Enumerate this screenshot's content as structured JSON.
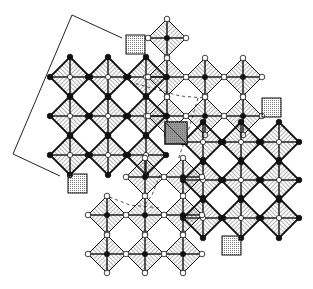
{
  "figure": {
    "colors": {
      "ink": "#111111",
      "hatch": "#555555",
      "shade": "#bbbbbb",
      "background": "#ffffff"
    }
  },
  "blocks": [
    {
      "name": "upper-left",
      "bold": true,
      "center_fill": "open",
      "apex_fill": "black",
      "cols": [
        70,
        108,
        146
      ],
      "rows": [
        77,
        116,
        155
      ],
      "r": 20
    },
    {
      "name": "upper-right",
      "bold": false,
      "center_fill": "black",
      "apex_fill": "open",
      "cols": [
        167,
        205,
        243
      ],
      "rows": [
        38,
        77,
        116
      ],
      "r": 19,
      "skip": [
        [
          0,
          1
        ],
        [
          0,
          2
        ]
      ]
    },
    {
      "name": "lower-right",
      "bold": true,
      "center_fill": "open",
      "apex_fill": "black",
      "cols": [
        203,
        241,
        279
      ],
      "rows": [
        142,
        180,
        218
      ],
      "r": 20
    },
    {
      "name": "lower-left",
      "bold": false,
      "center_fill": "black",
      "apex_fill": "open",
      "cols": [
        107,
        145,
        183
      ],
      "rows": [
        177,
        215,
        254
      ],
      "r": 19,
      "skip": [
        [
          0,
          0
        ]
      ]
    }
  ],
  "highlight": {
    "name": "shaded-octahedron",
    "x": 165,
    "y": 122,
    "size": 22
  },
  "bracket": {
    "points": [
      [
        122,
        38
      ],
      [
        72,
        15
      ],
      [
        13,
        154
      ],
      [
        60,
        176
      ]
    ]
  }
}
